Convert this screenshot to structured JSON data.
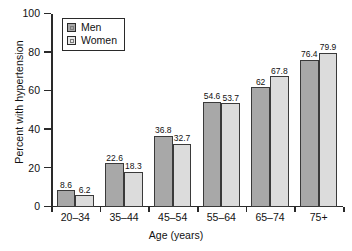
{
  "chart_data": {
    "type": "bar",
    "title": "",
    "xlabel": "Age (years)",
    "ylabel": "Percent with hypertension",
    "categories": [
      "20–34",
      "35–44",
      "45–54",
      "55–64",
      "65–74",
      "75+"
    ],
    "series": [
      {
        "name": "Men",
        "color": "#a8a8a8",
        "values": [
          8.6,
          22.6,
          36.8,
          54.6,
          62,
          76.4
        ],
        "labels": [
          "8.6",
          "22.6",
          "36.8",
          "54.6",
          "62",
          "76.4"
        ]
      },
      {
        "name": "Women",
        "color": "#dcdcdc",
        "values": [
          6.2,
          18.3,
          32.7,
          53.7,
          67.8,
          79.9
        ],
        "labels": [
          "6.2",
          "18.3",
          "32.7",
          "53.7",
          "67.8",
          "79.9"
        ]
      }
    ],
    "ylim": [
      0,
      100
    ],
    "yticks": [
      0,
      20,
      40,
      60,
      80,
      100
    ],
    "ytick_labels": [
      "0",
      "20",
      "40",
      "60",
      "80",
      "100"
    ],
    "grid": false,
    "legend_position": "upper-left-inside",
    "legend_entries": [
      "Men",
      "Women"
    ]
  }
}
